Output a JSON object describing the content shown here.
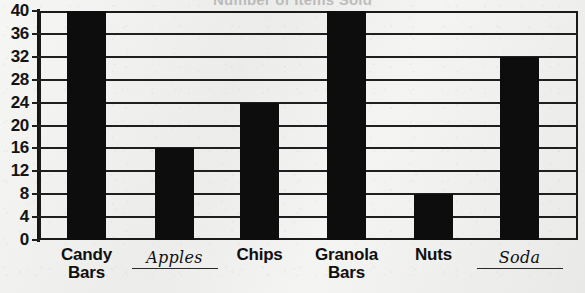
{
  "chart_data": {
    "type": "bar",
    "title": "Number of Items Sold",
    "xlabel": "",
    "ylabel": "",
    "categories": [
      "Candy Bars",
      "Apples",
      "Chips",
      "Granola Bars",
      "Nuts",
      "Soda"
    ],
    "values": [
      40,
      16,
      24,
      40,
      8,
      32
    ],
    "ylim": [
      0,
      40
    ],
    "ytick_labels": [
      "40",
      "36",
      "32",
      "28",
      "24",
      "20",
      "16",
      "12",
      "8",
      "4",
      "0"
    ],
    "ytick_values": [
      40,
      36,
      32,
      28,
      24,
      20,
      16,
      12,
      8,
      4,
      0
    ],
    "ytick_step": 4,
    "grid": true,
    "legend": false,
    "bar_color": "#0d0d0d",
    "background_color": "#f2f2f1",
    "axis_color": "#1a1a1a",
    "label_styles": [
      "printed",
      "handwritten",
      "printed",
      "printed",
      "printed",
      "handwritten"
    ],
    "category_lines": [
      [
        "Candy",
        "Bars"
      ],
      [
        "Apples"
      ],
      [
        "Chips"
      ],
      [
        "Granola",
        "Bars"
      ],
      [
        "Nuts"
      ],
      [
        "Soda"
      ]
    ]
  }
}
